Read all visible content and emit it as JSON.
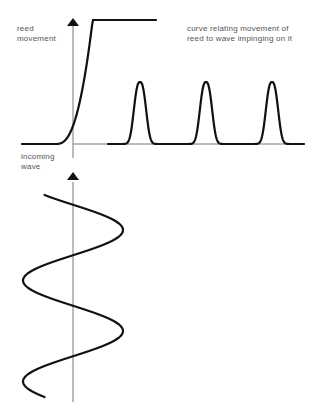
{
  "diagram": {
    "title_caption": "curve relating movement of\nreed to wave impinging on it",
    "top_axis_label": "reed\nmovement",
    "bottom_axis_label": "incoming\nwave",
    "line_color": "#111111",
    "axis_color": "#555555",
    "text_color": "#555555",
    "response_curve": {
      "description": "nonlinear reed response: flat below threshold, rising steeply above",
      "type": "threshold-rising"
    },
    "output_pulses": {
      "count": 3,
      "description": "rectified pulses produced by reed, one per wave crest"
    },
    "incoming_wave": {
      "type": "sine",
      "cycles": 2,
      "orientation": "vertical (time runs downward)"
    }
  }
}
